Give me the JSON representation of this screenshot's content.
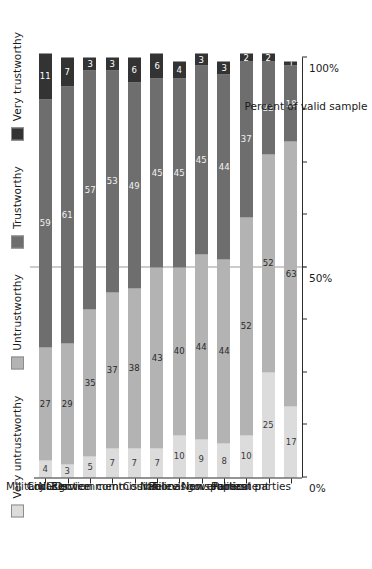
{
  "chart_data": {
    "type": "bar",
    "orientation": "horizontal-stacked",
    "title": "",
    "xlabel": "Percent of valid sample",
    "ylabel": "",
    "xlim": [
      0,
      100
    ],
    "xticks": [
      0,
      50,
      100
    ],
    "xticklabels": [
      "0%",
      "50%",
      "100%"
    ],
    "minor_ticks": [
      12.5,
      25,
      37.5,
      62.5,
      75,
      87.5
    ],
    "grid": false,
    "reference_line": 50,
    "legend_position": "top",
    "categories": [
      "Military",
      "NGOs",
      "Civil service",
      "Local government",
      "Election commission",
      "Courts",
      "Police",
      "Television",
      "National government",
      "Newspapers",
      "Parliament",
      "Political parties"
    ],
    "series": [
      {
        "name": "Very untrustworthy",
        "color": "#dcdcdc",
        "values": [
          4,
          3,
          5,
          7,
          7,
          7,
          10,
          9,
          8,
          10,
          25,
          17
        ]
      },
      {
        "name": "Untrustworthy",
        "color": "#b3b3b3",
        "values": [
          27,
          29,
          35,
          37,
          38,
          43,
          40,
          44,
          44,
          52,
          52,
          63
        ]
      },
      {
        "name": "Trustworthy",
        "color": "#6e6e6e",
        "values": [
          59,
          61,
          57,
          53,
          49,
          45,
          45,
          45,
          44,
          37,
          22,
          18
        ]
      },
      {
        "name": "Very trustworthy",
        "color": "#333333",
        "values": [
          11,
          7,
          3,
          3,
          6,
          6,
          4,
          3,
          3,
          2,
          2,
          1
        ]
      }
    ]
  },
  "legend": {
    "items": [
      {
        "label": "Very untrustworthy",
        "color": "#dcdcdc"
      },
      {
        "label": "Untrustworthy",
        "color": "#b3b3b3"
      },
      {
        "label": "Trustworthy",
        "color": "#6e6e6e"
      },
      {
        "label": "Very trustworthy",
        "color": "#333333"
      }
    ]
  },
  "axis": {
    "x_title": "Percent of valid sample"
  }
}
